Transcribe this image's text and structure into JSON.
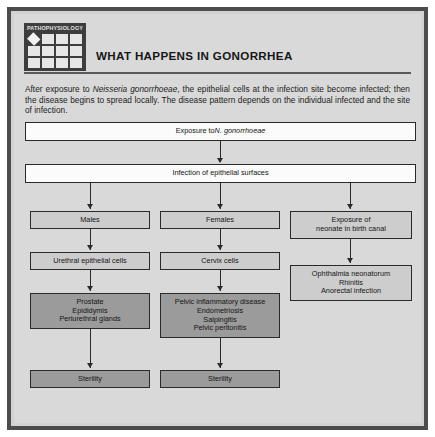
{
  "badge": {
    "label": "PATHOPHYSIOLOGY"
  },
  "header": {
    "title": "WHAT HAPPENS IN GONORRHEA"
  },
  "intro": {
    "text_before_italic": "After exposure to ",
    "italic_organism": "Neisseria gonorrhoeae",
    "text_after_italic": ", the epithelial cells at the infection site become infected; then the disease begins to spread locally. The disease pattern depends on the individual infected and the site of infection."
  },
  "flow": {
    "exposure": {
      "text_before_italic": "Exposure to ",
      "italic_organism": "N. gonorrhoeae"
    },
    "infection": "Infection of epithelial surfaces",
    "columns": [
      {
        "head": "Males",
        "second": "Urethral epithelial cells",
        "detail": "Prostate\nEpididymis\nPeriurethral glands",
        "outcome": "Sterility"
      },
      {
        "head": "Females",
        "second": "Cervix cells",
        "detail": "Pelvic inflammatory disease\nEndometriosis\nSalpingitis\nPelvic peritonitis",
        "outcome": "Sterility"
      },
      {
        "head": "Exposure of\nneonate in birth canal",
        "detail": "Ophthalmia neonatorum\nRhinitis\nAnorectal infection"
      }
    ]
  },
  "colors": {
    "frame": "#4c4c4c",
    "panel": "#d9d9d9",
    "box_white": "#fbfbfb",
    "box_light": "#cdcdcd",
    "box_dark": "#9b9b9b",
    "badge_bg": "#3d3d3d"
  }
}
